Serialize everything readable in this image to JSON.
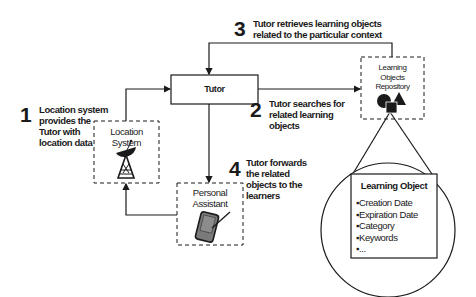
{
  "diagram": {
    "nodes": {
      "tutor": {
        "label": "Tutor"
      },
      "location_system": {
        "label_line1": "Location",
        "label_line2": "System",
        "icon": "satellite-dish-icon"
      },
      "personal_assistant": {
        "label_line1": "Personal",
        "label_line2": "Assistant",
        "icon": "pda-device-icon"
      },
      "repository": {
        "label_line1": "Learning",
        "label_line2": "Objects",
        "label_line3": "Repository",
        "icon": "shapes-icon"
      }
    },
    "steps": [
      {
        "number": "1",
        "lines": [
          "Location system",
          "provides the",
          "Tutor with",
          "location data"
        ]
      },
      {
        "number": "2",
        "lines": [
          "Tutor searches for",
          "related learning",
          "objects"
        ]
      },
      {
        "number": "3",
        "lines": [
          "Tutor retrieves learning objects",
          "related to the particular context"
        ]
      },
      {
        "number": "4",
        "lines": [
          "Tutor forwards",
          "the related",
          "objects to the",
          "learners"
        ]
      }
    ],
    "learning_object": {
      "title": "Learning Object",
      "items": [
        "Creation Date",
        "Expiration Date",
        "Category",
        "Keywords",
        "..."
      ]
    },
    "colors": {
      "line": "#1a1a1a",
      "background": "#ffffff",
      "icon_fill": "#6e6e6e"
    }
  }
}
